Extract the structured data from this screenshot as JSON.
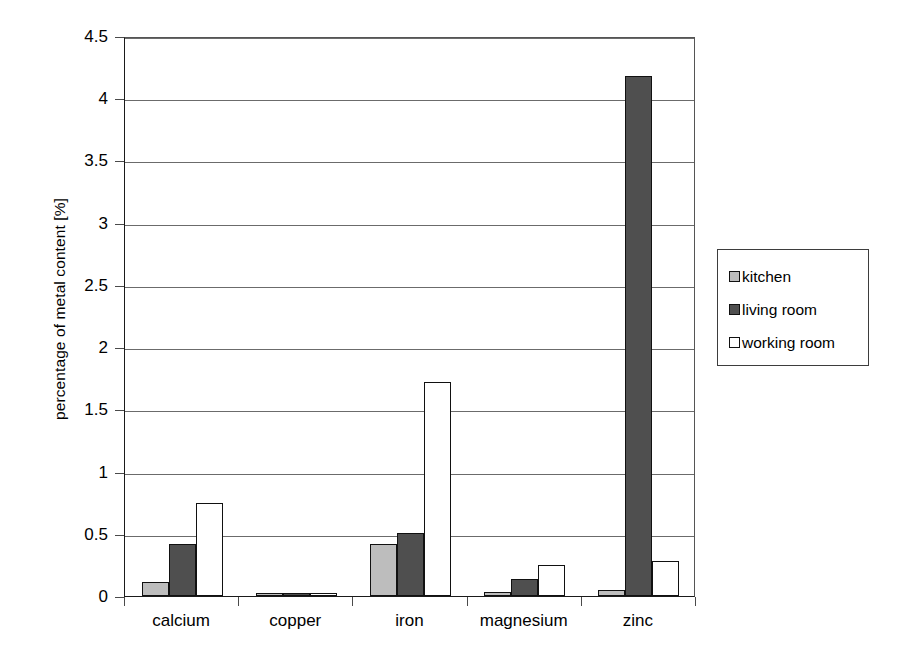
{
  "chart_data": {
    "type": "bar",
    "title": "",
    "xlabel": "",
    "ylabel": "percentage of metal content [%]",
    "categories": [
      "calcium",
      "copper",
      "iron",
      "magnesium",
      "zinc"
    ],
    "series": [
      {
        "name": "kitchen",
        "color": "#bdbdbd",
        "values": [
          0.11,
          0.01,
          0.42,
          0.03,
          0.05
        ]
      },
      {
        "name": "living room",
        "color": "#4f4f4f",
        "values": [
          0.42,
          0.02,
          0.51,
          0.14,
          4.18
        ]
      },
      {
        "name": "working room",
        "color": "#ffffff",
        "values": [
          0.75,
          0.02,
          1.72,
          0.25,
          0.28
        ]
      }
    ],
    "ylim": [
      0,
      4.5
    ],
    "yticks": [
      0,
      0.5,
      1,
      1.5,
      2,
      2.5,
      3,
      3.5,
      4,
      4.5
    ],
    "ytick_labels": [
      "0",
      "0.5",
      "1",
      "1.5",
      "2",
      "2.5",
      "3",
      "3.5",
      "4",
      "4.5"
    ],
    "grid": true,
    "legend_position": "right"
  }
}
